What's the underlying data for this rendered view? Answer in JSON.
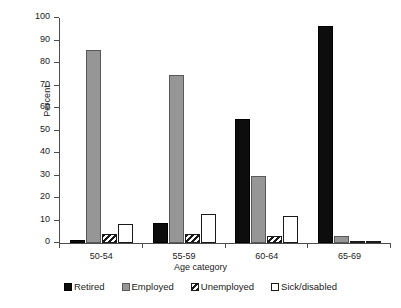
{
  "chart_data": {
    "type": "bar",
    "title": "",
    "xlabel": "Age category",
    "ylabel": "Percent",
    "categories": [
      "50-54",
      "55-59",
      "60-64",
      "65-69"
    ],
    "ylim": [
      0,
      100
    ],
    "yticks": [
      0,
      10,
      20,
      30,
      40,
      50,
      60,
      70,
      80,
      90,
      100
    ],
    "grid": false,
    "legend_position": "bottom",
    "series": [
      {
        "name": "Retired",
        "fill": "solid-black",
        "color": "#0d0d0d",
        "values": [
          1.5,
          9,
          55,
          96.5
        ]
      },
      {
        "name": "Employed",
        "fill": "solid-gray",
        "color": "#969696",
        "values": [
          86,
          74.5,
          30,
          3
        ]
      },
      {
        "name": "Unemployed",
        "fill": "diagonal-hatch",
        "color": "#ffffff",
        "values": [
          4,
          4,
          3,
          0.5
        ]
      },
      {
        "name": "Sick/disabled",
        "fill": "white-outline",
        "color": "#ffffff",
        "values": [
          8.5,
          13,
          12,
          1
        ]
      }
    ]
  },
  "axes": {
    "y_title": "Percent",
    "x_title": "Age category",
    "y_tick_labels": [
      "0",
      "10",
      "20",
      "30",
      "40",
      "50",
      "60",
      "70",
      "80",
      "90",
      "100"
    ],
    "x_tick_labels": [
      "50-54",
      "55-59",
      "60-64",
      "65-69"
    ]
  },
  "legend": {
    "items": [
      {
        "label": "Retired"
      },
      {
        "label": "Employed"
      },
      {
        "label": "Unemployed"
      },
      {
        "label": "Sick/disabled"
      }
    ]
  }
}
